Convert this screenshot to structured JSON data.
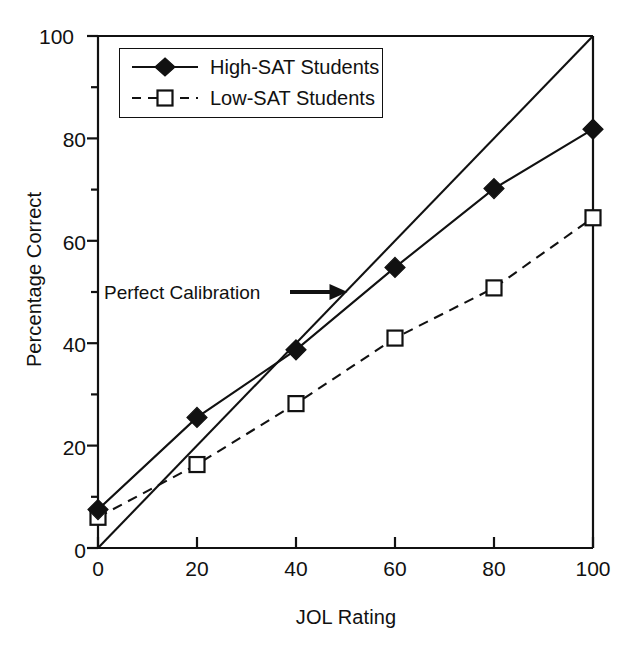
{
  "chart_data": {
    "type": "line",
    "title": "",
    "xlabel": "JOL Rating",
    "ylabel": "Percentage Correct",
    "xlim": [
      0,
      100
    ],
    "ylim": [
      0,
      100
    ],
    "x": [
      0,
      20,
      40,
      60,
      80,
      100
    ],
    "xticks": [
      0,
      20,
      40,
      60,
      80,
      100
    ],
    "yticks": [
      0,
      20,
      40,
      60,
      80,
      100
    ],
    "y_minor_ticks": [
      10,
      30,
      50,
      70,
      90
    ],
    "grid": false,
    "legend_position": "upper-left",
    "series": [
      {
        "name": "High-SAT Students",
        "values": [
          7.5,
          25.5,
          38.7,
          54.8,
          70.2,
          81.8
        ],
        "marker": "filled-diamond",
        "line_style": "solid",
        "color": "#000000"
      },
      {
        "name": "Low-SAT Students",
        "values": [
          6.0,
          16.3,
          28.2,
          41.0,
          50.8,
          64.5
        ],
        "marker": "open-square",
        "line_style": "dashed",
        "color": "#000000"
      },
      {
        "name": "Perfect Calibration",
        "values": [
          0,
          20,
          40,
          60,
          80,
          100
        ],
        "marker": "none",
        "line_style": "solid",
        "color": "#000000"
      }
    ],
    "annotations": [
      {
        "text": "Perfect Calibration",
        "target_x": 50,
        "target_y": 50,
        "arrow": "right"
      }
    ]
  },
  "axes": {
    "y_title": "Percentage Correct",
    "x_title": "JOL Rating",
    "y_tick_labels": [
      "0",
      "20",
      "40",
      "60",
      "80",
      "100"
    ],
    "x_tick_labels": [
      "0",
      "20",
      "40",
      "60",
      "80",
      "100"
    ]
  },
  "legend": {
    "entries": [
      {
        "label": "High-SAT Students"
      },
      {
        "label": "Low-SAT Students"
      }
    ]
  },
  "annotation": {
    "label": "Perfect Calibration"
  }
}
